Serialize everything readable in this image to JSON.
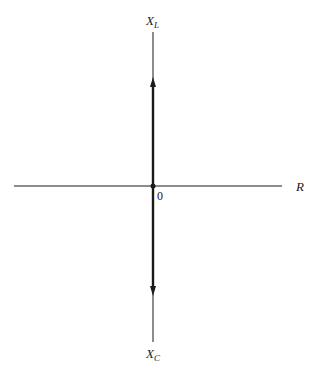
{
  "diagram": {
    "type": "impedance-plane-axes",
    "axes": {
      "vertical_top_label": {
        "main": "X",
        "sub": "L"
      },
      "vertical_bottom_label": {
        "main": "X",
        "sub": "C"
      },
      "horizontal_right_label": "R",
      "origin_label": "0"
    },
    "colors": {
      "line": "#1a1a1a",
      "background": "#ffffff"
    },
    "vectors": [
      {
        "name": "inductive-reactance-vector",
        "direction": "up"
      },
      {
        "name": "capacitive-reactance-vector",
        "direction": "down"
      }
    ]
  }
}
